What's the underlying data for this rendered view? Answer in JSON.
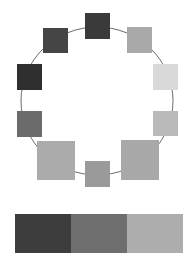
{
  "diagram": {
    "type": "ring-of-color-swatches",
    "ring": {
      "cx": 97,
      "cy": 101,
      "rx": 76,
      "ry": 74,
      "stroke": "#6b6b6b"
    },
    "nodes": [
      {
        "name": "top",
        "x": 85,
        "y": 13,
        "w": 25,
        "h": 26,
        "color": "#3a3a3a"
      },
      {
        "name": "top-right",
        "x": 127,
        "y": 27,
        "w": 25,
        "h": 26,
        "color": "#a9a9a9"
      },
      {
        "name": "right",
        "x": 153,
        "y": 64,
        "w": 25,
        "h": 26,
        "color": "#d9d9d9"
      },
      {
        "name": "lower-right",
        "x": 153,
        "y": 111,
        "w": 25,
        "h": 25,
        "color": "#b9b9b9"
      },
      {
        "name": "bottom-right-large",
        "x": 121,
        "y": 140,
        "w": 38,
        "h": 40,
        "color": "#a8a8a8"
      },
      {
        "name": "bottom",
        "x": 85,
        "y": 161,
        "w": 25,
        "h": 26,
        "color": "#9a9a9a"
      },
      {
        "name": "bottom-left-large",
        "x": 37,
        "y": 141,
        "w": 38,
        "h": 39,
        "color": "#ababab"
      },
      {
        "name": "lower-left",
        "x": 17,
        "y": 111,
        "w": 25,
        "h": 26,
        "color": "#6b6b6b"
      },
      {
        "name": "left",
        "x": 17,
        "y": 64,
        "w": 25,
        "h": 26,
        "color": "#2f2f2f"
      },
      {
        "name": "top-left",
        "x": 43,
        "y": 28,
        "w": 25,
        "h": 25,
        "color": "#454545"
      }
    ],
    "palette_bar": [
      {
        "name": "dark",
        "color": "#3d3d3d"
      },
      {
        "name": "medium",
        "color": "#6e6e6e"
      },
      {
        "name": "light",
        "color": "#adadad"
      }
    ]
  }
}
